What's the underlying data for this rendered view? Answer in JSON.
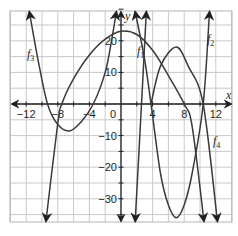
{
  "chart_data": {
    "type": "line",
    "title": "",
    "xlabel": "x",
    "ylabel": "y",
    "xlim": [
      -14,
      14
    ],
    "ylim": [
      -38,
      32
    ],
    "grid": true,
    "x_ticks": [
      "−12",
      "−8",
      "−4",
      "0",
      "4",
      "8",
      "12"
    ],
    "y_ticks": [
      "20",
      "10",
      "−10",
      "−20",
      "−30"
    ],
    "origin_label": "0",
    "series": [
      {
        "name": "f1",
        "label": "f",
        "sub": "1",
        "description": "downward-opening curve, peak near (0, 23), zeros near x=-7.5 and x=8",
        "points": [
          [
            -9.5,
            -40
          ],
          [
            -8,
            -6
          ],
          [
            -7.5,
            0
          ],
          [
            -6,
            8
          ],
          [
            -4,
            15.5
          ],
          [
            -2,
            20.5
          ],
          [
            0,
            23
          ],
          [
            2,
            22
          ],
          [
            4,
            17
          ],
          [
            6,
            9
          ],
          [
            8,
            0
          ],
          [
            9,
            -7
          ],
          [
            10.5,
            -38
          ]
        ]
      },
      {
        "name": "f2",
        "label": "f",
        "sub": "2",
        "description": "steep upward-opening curve, min near (7, -36), zeros near x=3.8 and x=10.4",
        "points": [
          [
            1.8,
            32
          ],
          [
            3,
            14
          ],
          [
            3.8,
            0
          ],
          [
            5,
            -22
          ],
          [
            6,
            -32
          ],
          [
            7,
            -36
          ],
          [
            8,
            -32
          ],
          [
            9,
            -22
          ],
          [
            10.4,
            0
          ],
          [
            11.2,
            32
          ]
        ]
      },
      {
        "name": "f3",
        "label": "f",
        "sub": "3",
        "description": "upward-opening curve, min near (-6.5, -8.5), zeros near x=-9.3 and x=-3.5",
        "points": [
          [
            -11.6,
            32
          ],
          [
            -10.5,
            14
          ],
          [
            -9.3,
            0
          ],
          [
            -8,
            -6.5
          ],
          [
            -6.5,
            -8.5
          ],
          [
            -5,
            -5.5
          ],
          [
            -3.5,
            0
          ],
          [
            -2,
            10
          ],
          [
            -1.2,
            20
          ],
          [
            -0.6,
            32
          ]
        ]
      },
      {
        "name": "f4",
        "label": "f",
        "sub": "4",
        "description": "steep then hump curve: down from top near x=3.4 to bottom near x=1.8 and a hump peaking near (7, 18) descending to bottom near x=12",
        "points": [
          [
            3.2,
            32
          ],
          [
            2.6,
            0
          ],
          [
            1.8,
            -38
          ],
          [
            3.8,
            0
          ],
          [
            5,
            12
          ],
          [
            7,
            18
          ],
          [
            8.5,
            12
          ],
          [
            10.4,
            0
          ],
          [
            12.2,
            -38
          ]
        ]
      }
    ]
  }
}
